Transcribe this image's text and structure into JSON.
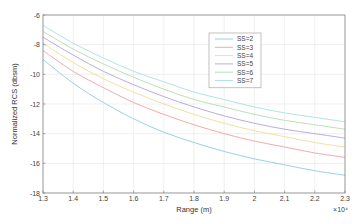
{
  "chart_data": {
    "type": "line",
    "title": "",
    "xlabel": "Range (m)",
    "ylabel": "Normalized RCS (dbsm)",
    "x_exponent_label": "×10⁴",
    "xlim": [
      1.3,
      2.3
    ],
    "ylim": [
      -18,
      -6
    ],
    "x_ticks": [
      "1.3",
      "1.4",
      "1.5",
      "1.6",
      "1.7",
      "1.8",
      "1.9",
      "2",
      "2.1",
      "2.2",
      "2.3"
    ],
    "y_ticks": [
      "-6",
      "-8",
      "-10",
      "-12",
      "-14",
      "-16",
      "-18"
    ],
    "grid": true,
    "legend_position": "upper-right-inside",
    "x": [
      1.3,
      1.4,
      1.5,
      1.6,
      1.7,
      1.8,
      1.9,
      2.0,
      2.1,
      2.2,
      2.3
    ],
    "series": [
      {
        "name": "SS=2",
        "color": "#8fc9e6",
        "values": [
          -9.0,
          -10.6,
          -11.9,
          -13.0,
          -13.9,
          -14.6,
          -15.2,
          -15.7,
          -16.1,
          -16.5,
          -16.8
        ]
      },
      {
        "name": "SS=3",
        "color": "#f0a0a0",
        "values": [
          -8.4,
          -9.8,
          -10.9,
          -11.9,
          -12.7,
          -13.4,
          -14.0,
          -14.5,
          -14.9,
          -15.3,
          -15.6
        ]
      },
      {
        "name": "SS=4",
        "color": "#f2dc96",
        "values": [
          -7.9,
          -9.2,
          -10.3,
          -11.2,
          -12.0,
          -12.7,
          -13.3,
          -13.8,
          -14.2,
          -14.6,
          -14.9
        ]
      },
      {
        "name": "SS=5",
        "color": "#b6a2d6",
        "values": [
          -7.5,
          -8.7,
          -9.8,
          -10.7,
          -11.5,
          -12.2,
          -12.8,
          -13.3,
          -13.7,
          -14.0,
          -14.3
        ]
      },
      {
        "name": "SS=6",
        "color": "#b4dcaa",
        "values": [
          -7.1,
          -8.3,
          -9.3,
          -10.2,
          -11.0,
          -11.7,
          -12.2,
          -12.7,
          -13.1,
          -13.4,
          -13.7
        ]
      },
      {
        "name": "SS=7",
        "color": "#a6e2dc",
        "values": [
          -6.7,
          -7.9,
          -8.9,
          -9.8,
          -10.5,
          -11.2,
          -11.7,
          -12.2,
          -12.6,
          -12.9,
          -13.2
        ]
      }
    ]
  }
}
